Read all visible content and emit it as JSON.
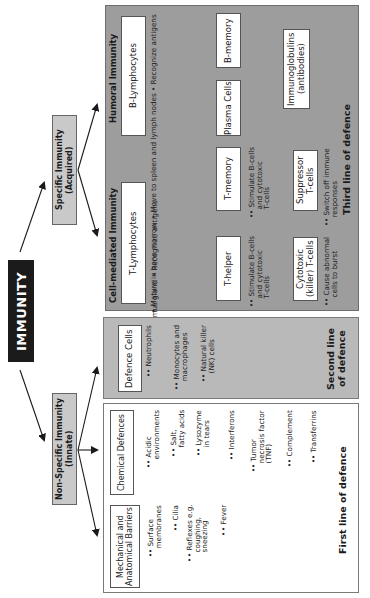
{
  "title": "IMMUNITY",
  "branches": {
    "specific": {
      "title": "Specific Immunity",
      "subtitle": "(Acquired)"
    },
    "non_specific": {
      "title": "Non-Specific Immunity",
      "subtitle": "(Innate)"
    }
  },
  "third_line": {
    "label": "Third line of defence",
    "humoral": {
      "title": "Humoral Immunity",
      "b_lymphocytes": {
        "label": "B-Lymphocytes",
        "bullets": [
          "Mature in bone marrow",
          "Move to spleen and lymph nodes",
          "Recognize antigens"
        ]
      },
      "plasma_cells": "Plasma Cells",
      "b_memory": "B-memory",
      "immunoglobulins": {
        "line1": "Immunoglobulins",
        "line2": "(antibodies)"
      }
    },
    "cell_mediated": {
      "title": "Cell-mediated Immunity",
      "t_lymphocytes": {
        "label": "T-Lymphocytes",
        "bullets": [
          "Mature in thymus gland",
          "Recognize antigens"
        ]
      },
      "t_helper": {
        "label": "T-helper",
        "bullet": [
          "Stimulate B-cells",
          "and cytotoxic",
          "T-cells"
        ]
      },
      "t_memory": {
        "label": "T-memory",
        "bullet": [
          "Stimulate B-cells",
          "and cytotoxic",
          "T-cells"
        ]
      },
      "cytotoxic": {
        "line1": "Cytotoxic",
        "line2": "(killer) T-cells",
        "bullet": [
          "Cause abnormal",
          "cells to burst"
        ]
      },
      "suppressor": {
        "line1": "Suppressor",
        "line2": "T-cells",
        "bullet": [
          "Switch off immune",
          "responses"
        ]
      }
    }
  },
  "second_line": {
    "label_line1": "Second line",
    "label_line2": "of defence",
    "defence_cells": {
      "label": "Defence Cells",
      "bullets": [
        [
          "Neutrophils"
        ],
        [
          "Monocytes and",
          "macrophages"
        ],
        [
          "Natural killer",
          "(NK) cells"
        ]
      ]
    }
  },
  "first_line": {
    "label": "First line of defence",
    "mechanical": {
      "line1": "Mechanical and",
      "line2": "Anatomical Barriers",
      "bullets": [
        [
          "Surface",
          "membranes"
        ],
        [
          "Cilia"
        ],
        [
          "Reflexes e.g.",
          "coughing,",
          "sneezing"
        ],
        [
          "Fever"
        ]
      ]
    },
    "chemical": {
      "label": "Chemical Defences",
      "bullets": [
        [
          "Acidic",
          "environments"
        ],
        [
          "Salt,",
          "fatty acids"
        ],
        [
          "Lysozyme",
          "in tears"
        ],
        [
          "Interferons"
        ],
        [
          "Tumor",
          "necrosis factor",
          "(TNF)"
        ],
        [
          "Complement"
        ],
        [
          "Transferrins"
        ]
      ]
    }
  },
  "colors": {
    "third_panel": "#9d9d9d",
    "second_panel": "#b9b9b9",
    "first_panel": "#ffffff",
    "category_box": "#c9c9c9",
    "title_box": "#1b1b1b"
  }
}
